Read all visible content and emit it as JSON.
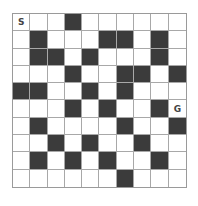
{
  "maze": {
    "rows": 10,
    "cols": 10,
    "colors": {
      "wall": "#3b3b3b",
      "open": "#ffffff",
      "gridline": "#a8a8a8"
    },
    "start": {
      "row": 0,
      "col": 0,
      "label": "S"
    },
    "goal": {
      "row": 5,
      "col": 9,
      "label": "G"
    },
    "layout": [
      "...#......",
      ".#...##.#.",
      ".##.#...#.",
      "...#..##.#",
      "##..#.#...",
      "...#.#..#.",
      ".#....#..#",
      "..#.#..#..",
      ".#.#.#..#.",
      "......#..."
    ]
  }
}
